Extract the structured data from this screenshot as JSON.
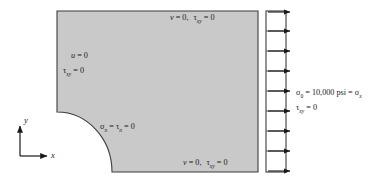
{
  "figure": {
    "type": "plane-stress-boundary-condition-diagram",
    "body": {
      "fill_color": "#c9c9c9",
      "stroke_color": "#3c3c3c",
      "shape": "rectangle-with-quarter-circle-notch-lower-left"
    },
    "traction_band": {
      "arrow_count": 9,
      "fill_color": "#ffffff",
      "stroke_color": "#3c3c3c",
      "direction": "right"
    }
  },
  "labels": {
    "top_bc": {
      "part1": "v",
      "eq1": " = 0,",
      "part2": "τ",
      "sub2": "xy",
      "eq2": " = 0"
    },
    "left_bc_line1": {
      "part1": "u",
      "eq1": " = 0"
    },
    "left_bc_line2": {
      "part2": "τ",
      "sub2": "xy",
      "eq2": " = 0"
    },
    "notch_bc": {
      "part1": "σ",
      "sub1": "n",
      "eq1": " = ",
      "part2": "τ",
      "sub2": "n",
      "eq2": " = 0"
    },
    "bottom_bc": {
      "part1": "v",
      "eq1": " = 0,",
      "part2": "τ",
      "sub2": "xy",
      "eq2": " = 0"
    },
    "load_line1": {
      "sigma": "σ",
      "sub_zero": "0",
      "eq": " = ",
      "value": "10,000",
      "unit": " psi = ",
      "sigma_x": "σ",
      "sub_x": "x"
    },
    "load_line2": {
      "tau": "τ",
      "sub": "xy",
      "eq": " = 0"
    }
  },
  "axes": {
    "x_label": "x",
    "y_label": "y"
  }
}
